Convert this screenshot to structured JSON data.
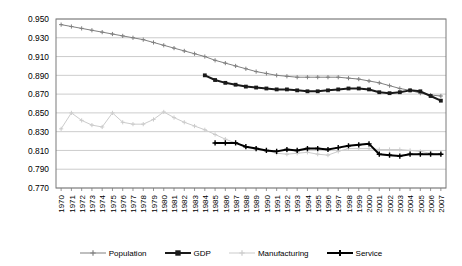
{
  "chart_data": {
    "type": "line",
    "title": "",
    "xlabel": "",
    "ylabel": "",
    "grid": true,
    "legend_position": "bottom",
    "ylim": [
      0.77,
      0.95
    ],
    "ytick_step": 0.02,
    "ytick_labels": [
      "0.950",
      "0.930",
      "0.910",
      "0.890",
      "0.870",
      "0.850",
      "0.830",
      "0.810",
      "0.790",
      "0.770"
    ],
    "ytick_values": [
      0.95,
      0.93,
      0.91,
      0.89,
      0.87,
      0.85,
      0.83,
      0.81,
      0.79,
      0.77
    ],
    "x": [
      1970,
      1971,
      1972,
      1973,
      1974,
      1975,
      1976,
      1977,
      1978,
      1979,
      1980,
      1981,
      1982,
      1983,
      1984,
      1985,
      1986,
      1987,
      1988,
      1989,
      1990,
      1991,
      1992,
      1993,
      1994,
      1995,
      1996,
      1997,
      1998,
      1999,
      2000,
      2001,
      2002,
      2003,
      2004,
      2005,
      2006,
      2007
    ],
    "categories": [
      "1970",
      "1971",
      "1972",
      "1973",
      "1974",
      "1975",
      "1976",
      "1977",
      "1978",
      "1979",
      "1980",
      "1981",
      "1982",
      "1983",
      "1984",
      "1985",
      "1986",
      "1987",
      "1988",
      "1989",
      "1990",
      "1991",
      "1992",
      "1993",
      "1994",
      "1995",
      "1996",
      "1997",
      "1998",
      "1999",
      "2000",
      "2001",
      "2002",
      "2003",
      "2004",
      "2005",
      "2006",
      "2007"
    ],
    "series": [
      {
        "name": "Population",
        "color": "#808080",
        "marker": "plus",
        "width": 1,
        "values": [
          0.944,
          0.942,
          0.94,
          0.938,
          0.936,
          0.934,
          0.932,
          0.93,
          0.928,
          0.925,
          0.922,
          0.919,
          0.916,
          0.913,
          0.91,
          0.906,
          0.903,
          0.9,
          0.897,
          0.894,
          0.892,
          0.89,
          0.889,
          0.888,
          0.888,
          0.888,
          0.888,
          0.888,
          0.887,
          0.886,
          0.884,
          0.882,
          0.879,
          0.876,
          0.874,
          0.871,
          0.869,
          0.868
        ]
      },
      {
        "name": "GDP",
        "color": "#1a1a1a",
        "marker": "square",
        "width": 2,
        "values": [
          null,
          null,
          null,
          null,
          null,
          null,
          null,
          null,
          null,
          null,
          null,
          null,
          null,
          null,
          0.89,
          0.885,
          0.882,
          0.88,
          0.878,
          0.877,
          0.876,
          0.875,
          0.875,
          0.874,
          0.873,
          0.873,
          0.874,
          0.875,
          0.876,
          0.876,
          0.875,
          0.872,
          0.871,
          0.872,
          0.874,
          0.873,
          0.868,
          0.863
        ]
      },
      {
        "name": "Manufacturing",
        "color": "#cccccc",
        "marker": "plus",
        "width": 1,
        "values": [
          0.833,
          0.85,
          0.842,
          0.837,
          0.835,
          0.85,
          0.84,
          0.838,
          0.838,
          0.843,
          0.851,
          0.845,
          0.84,
          0.836,
          0.832,
          0.827,
          0.822,
          0.818,
          0.814,
          0.812,
          0.81,
          0.807,
          0.806,
          0.807,
          0.808,
          0.806,
          0.805,
          0.809,
          0.812,
          0.812,
          0.812,
          0.811,
          0.811,
          0.811,
          0.81,
          0.809,
          0.807,
          0.806
        ]
      },
      {
        "name": "Service",
        "color": "#000000",
        "marker": "plus",
        "width": 2,
        "values": [
          null,
          null,
          null,
          null,
          null,
          null,
          null,
          null,
          null,
          null,
          null,
          null,
          null,
          null,
          null,
          0.818,
          0.818,
          0.818,
          0.814,
          0.812,
          0.81,
          0.809,
          0.811,
          0.81,
          0.812,
          0.812,
          0.811,
          0.813,
          0.815,
          0.816,
          0.817,
          0.806,
          0.805,
          0.804,
          0.806,
          0.806,
          0.806,
          0.806
        ]
      }
    ]
  },
  "legend": {
    "items": [
      {
        "label": "Population"
      },
      {
        "label": "GDP"
      },
      {
        "label": "Manufacturing"
      },
      {
        "label": "Service"
      }
    ]
  }
}
